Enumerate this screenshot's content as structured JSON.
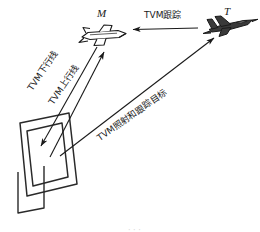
{
  "figure": {
    "background_color": "#ffffff",
    "line_color": "#1a1a1a"
  },
  "entities": {
    "missile": {
      "id_label": "M",
      "icon": "missile-icon"
    },
    "target": {
      "id_label": "T",
      "icon": "fighter-jet-icon"
    },
    "radar": {
      "icon": "phased-array-radar-icon"
    }
  },
  "links": {
    "tvm_track": {
      "label": "TVM跟踪",
      "from": "T",
      "to": "M",
      "arrow": "single-left"
    },
    "downlink": {
      "label": "TVM下行线",
      "from": "M",
      "to": "radar",
      "arrow": "single-down-left"
    },
    "uplink": {
      "label": "TVM上行线",
      "from": "radar",
      "to": "M",
      "arrow": "single-up-right"
    },
    "illuminate_track": {
      "label": "TVM照射和跟踪目标",
      "from": "radar",
      "to": "T",
      "arrow": "double"
    }
  },
  "caption": {
    "clipped_text": "· · ·"
  }
}
